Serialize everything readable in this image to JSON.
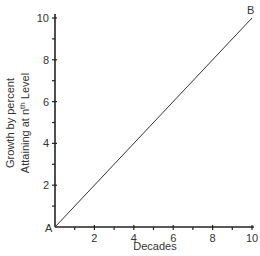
{
  "chart_data": {
    "type": "line",
    "title": "",
    "xlabel": "Decades",
    "ylabel_line1": "Growth by percent",
    "ylabel_line2_prefix": "Attaining at n",
    "ylabel_line2_sup": "th",
    "ylabel_line2_suffix": " Level",
    "xlim": [
      0,
      10
    ],
    "ylim": [
      0,
      10
    ],
    "x_ticks": [
      2,
      4,
      6,
      8,
      10
    ],
    "x_minor_ticks": [
      1,
      3,
      5,
      7,
      9
    ],
    "y_ticks": [
      2,
      4,
      6,
      8,
      10
    ],
    "y_minor_ticks": [
      1,
      3,
      5,
      7,
      9
    ],
    "grid": false,
    "legend": null,
    "series": [
      {
        "name": "Growth",
        "x": [
          0,
          10
        ],
        "y": [
          0,
          10
        ]
      }
    ],
    "annotations": [
      {
        "label": "A",
        "x": 0,
        "y": 0
      },
      {
        "label": "B",
        "x": 10,
        "y": 10
      }
    ]
  }
}
